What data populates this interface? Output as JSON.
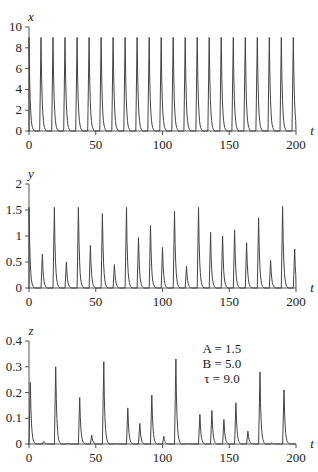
{
  "chart_data": [
    {
      "type": "line",
      "title": "",
      "xlabel": "t",
      "ylabel": "x",
      "xlim": [
        0,
        200
      ],
      "ylim": [
        0,
        10
      ],
      "xticks": [
        "0",
        "50",
        "100",
        "150",
        "200"
      ],
      "yticks": [
        "0",
        "2",
        "4",
        "6",
        "8",
        "10"
      ],
      "grid": false,
      "description": "Periodic spikes of height ~9 every ~9 time units",
      "peaks": {
        "t": [
          0,
          9,
          18,
          27,
          36,
          45,
          54,
          63,
          72,
          81,
          90,
          99,
          108,
          117,
          126,
          135,
          144,
          153,
          162,
          171,
          180,
          189,
          198
        ],
        "value": [
          9,
          9,
          9,
          9,
          9,
          9,
          9,
          9,
          9,
          9,
          9,
          9,
          9,
          9,
          9,
          9,
          9,
          9,
          9,
          9,
          9,
          9,
          9
        ]
      }
    },
    {
      "type": "line",
      "title": "",
      "xlabel": "t",
      "ylabel": "y",
      "xlim": [
        0,
        200
      ],
      "ylim": [
        0,
        2
      ],
      "xticks": [
        "0",
        "50",
        "100",
        "150",
        "200"
      ],
      "yticks": [
        "0",
        "0.5",
        "1",
        "1.5",
        "2"
      ],
      "grid": false,
      "peaks": {
        "t": [
          0,
          10,
          19,
          28,
          37,
          46,
          55,
          64,
          73,
          82,
          91,
          100,
          109,
          118,
          127,
          136,
          145,
          154,
          163,
          172,
          181,
          190,
          199
        ],
        "value": [
          1.55,
          0.65,
          1.55,
          0.5,
          1.55,
          0.82,
          1.43,
          0.45,
          1.55,
          0.97,
          1.2,
          0.78,
          1.48,
          0.42,
          1.55,
          1.07,
          1.0,
          1.12,
          0.87,
          1.35,
          0.53,
          1.57,
          0.75
        ]
      }
    },
    {
      "type": "line",
      "title": "",
      "xlabel": "t",
      "ylabel": "z",
      "xlim": [
        0,
        200
      ],
      "ylim": [
        0,
        0.4
      ],
      "xticks": [
        "0",
        "50",
        "100",
        "150",
        "200"
      ],
      "yticks": [
        "0",
        "0.1",
        "0.2",
        "0.3",
        "0.4"
      ],
      "grid": false,
      "annotation": [
        "A = 1.5",
        "B = 5.0",
        "τ = 9.0"
      ],
      "peaks": {
        "t": [
          1,
          11,
          20,
          29,
          38,
          47,
          56,
          65,
          74,
          83,
          92,
          101,
          110,
          119,
          128,
          137,
          146,
          155,
          164,
          173,
          182,
          191
        ],
        "value": [
          0.24,
          0.01,
          0.3,
          0.003,
          0.18,
          0.035,
          0.32,
          0.002,
          0.14,
          0.08,
          0.19,
          0.03,
          0.33,
          0.002,
          0.115,
          0.13,
          0.095,
          0.16,
          0.05,
          0.28,
          0.005,
          0.21
        ]
      }
    }
  ],
  "annotation": {
    "line1": "A = 1.5",
    "line2": "B = 5.0",
    "line3": "τ = 9.0"
  },
  "colors": {
    "line": "#444444",
    "axis": "#555555"
  }
}
